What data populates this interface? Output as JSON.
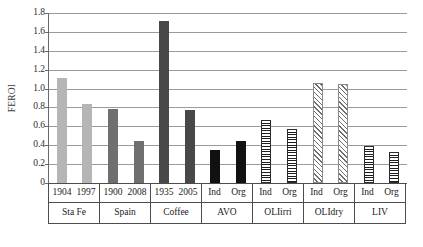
{
  "chart_data": {
    "type": "bar",
    "title": "",
    "xlabel": "",
    "ylabel": "FEROI",
    "ylim": [
      0,
      1.8
    ],
    "grid": true,
    "legend": "none",
    "yticks": [
      "0",
      "0.2",
      "0.4",
      "0.6",
      "0.8",
      "1.0",
      "1.2",
      "1.4",
      "1.6",
      "1.8"
    ],
    "ytick_values": [
      0,
      0.2,
      0.4,
      0.6,
      0.8,
      1.0,
      1.2,
      1.4,
      1.6,
      1.8
    ],
    "groups": [
      {
        "group_label": "Sta Fe",
        "style": "fill-light",
        "bars": [
          {
            "label": "1904",
            "value": 1.11
          },
          {
            "label": "1997",
            "value": 0.84
          }
        ]
      },
      {
        "group_label": "Spain",
        "style": "fill-medium",
        "bars": [
          {
            "label": "1900",
            "value": 0.78
          },
          {
            "label": "2008",
            "value": 0.45
          }
        ]
      },
      {
        "group_label": "Coffee",
        "style": "fill-dark",
        "bars": [
          {
            "label": "1935",
            "value": 1.72
          },
          {
            "label": "2005",
            "value": 0.77
          }
        ]
      },
      {
        "group_label": "AVO",
        "style": "fill-black",
        "bars": [
          {
            "label": "Ind",
            "value": 0.35
          },
          {
            "label": "Org",
            "value": 0.44
          }
        ]
      },
      {
        "group_label": "OLIirri",
        "style": "pat-hline",
        "bars": [
          {
            "label": "Ind",
            "value": 0.67
          },
          {
            "label": "Org",
            "value": 0.57
          }
        ]
      },
      {
        "group_label": "OLIdry",
        "style": "pat-diag",
        "bars": [
          {
            "label": "Ind",
            "value": 1.06
          },
          {
            "label": "Org",
            "value": 1.05
          }
        ]
      },
      {
        "group_label": "LIV",
        "style": "pat-grid",
        "bars": [
          {
            "label": "Ind",
            "value": 0.39
          },
          {
            "label": "Org",
            "value": 0.33
          }
        ]
      }
    ],
    "colors": {
      "fill-light": "#b5b5b5",
      "fill-medium": "#6f6f6f",
      "fill-dark": "#484848",
      "fill-black": "#111111",
      "gridline": "#9a9a9a",
      "axis": "#5a5a5a",
      "text": "#1a1a1a"
    }
  }
}
